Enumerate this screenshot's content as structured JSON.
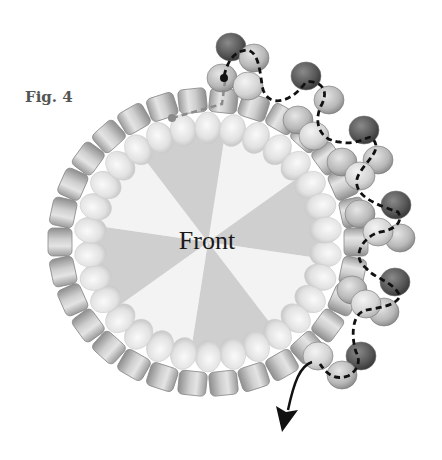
{
  "figure": {
    "label": "Fig. 4",
    "center_label": "Front"
  },
  "colors": {
    "background": "#ffffff",
    "cylinder_bead": "#c4c4c4",
    "round_bead": "#e6e6e6",
    "wedge_dark": "#cfcfcf",
    "wedge_light": "#f3f3f3",
    "picot_dark_bead": "#5a5a5a",
    "picot_mid_bead": "#b0b0b0",
    "thread": "#111111",
    "old_thread": "#8a8a8a"
  },
  "ring": {
    "center_x": 208,
    "center_y": 242,
    "outer_rx": 148,
    "outer_ry": 142,
    "inner_rx": 118,
    "inner_ry": 114,
    "cylinder_count": 30,
    "round_count": 30
  },
  "arrow": {
    "direction": "down-left",
    "end_x": 282,
    "end_y": 432
  }
}
